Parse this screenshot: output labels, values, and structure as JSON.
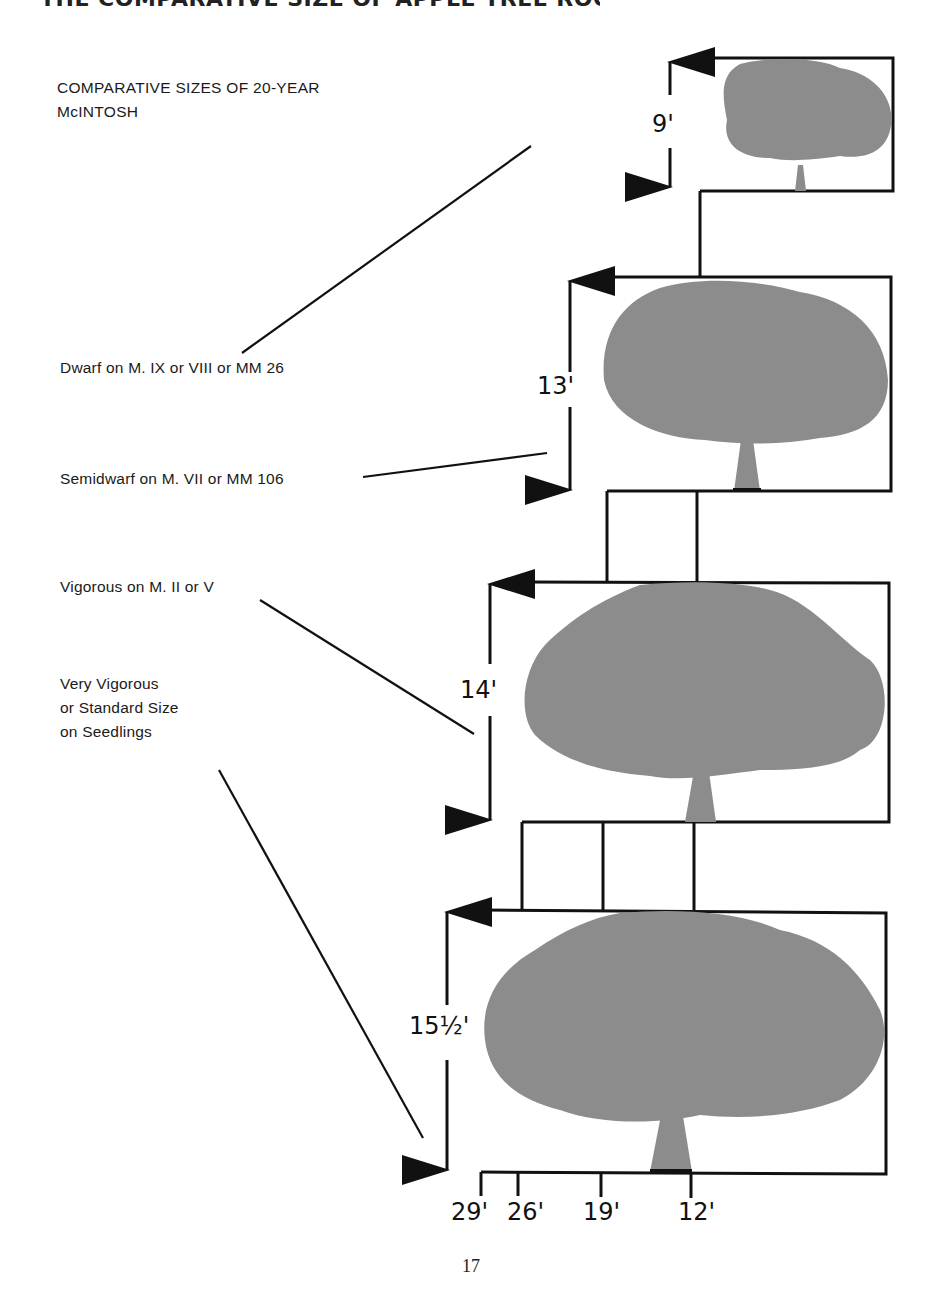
{
  "header": {
    "clipped_title": "THE COMPARATIVE SIZE OF APPLE TREE ROOTSTOCKS"
  },
  "diagram": {
    "title_line1": "COMPARATIVE SIZES OF 20-YEAR",
    "title_line2": "McINTOSH",
    "tree_color": "#8c8c8c",
    "line_color": "#111111",
    "trees": [
      {
        "id": "dwarf",
        "label": "Dwarf on M. IX or VIII or MM 26",
        "height_label": "9'",
        "height_ft": 9,
        "spread_ft": 12
      },
      {
        "id": "semidwarf",
        "label": "Semidwarf on M. VII or MM 106",
        "height_label": "13'",
        "height_ft": 13,
        "spread_ft": 19
      },
      {
        "id": "vigorous",
        "label": "Vigorous on M. II or V",
        "height_label": "14'",
        "height_ft": 14,
        "spread_ft": 26
      },
      {
        "id": "very-vigorous",
        "label_lines": [
          "Very Vigorous",
          "or Standard Size",
          "on Seedlings"
        ],
        "height_label": "15½'",
        "height_ft": 15.5,
        "spread_ft": 29
      }
    ],
    "spread_scale": [
      "29'",
      "26'",
      "19'",
      "12'"
    ]
  },
  "page": {
    "number": "17"
  }
}
